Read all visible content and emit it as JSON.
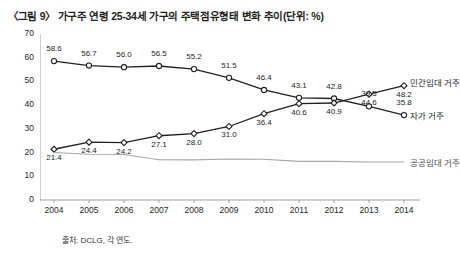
{
  "title": "〈그림 9〉 가구주 연령 25-34세 가구의 주택점유형태 변화 추이(단위: %)",
  "source": "출처: DCLG, 각 연도.",
  "chart_data": {
    "type": "line",
    "title": "〈그림 9〉 가구주 연령 25-34세 가구의 주택점유형태 변화 추이(단위: %)",
    "xlabel": "",
    "ylabel": "",
    "ylim": [
      0,
      70
    ],
    "yticks": [
      0,
      10,
      20,
      30,
      40,
      50,
      60,
      70
    ],
    "grid": false,
    "legend": "inline-right",
    "categories": [
      "2004",
      "2005",
      "2006",
      "2007",
      "2008",
      "2009",
      "2010",
      "2011",
      "2012",
      "2013",
      "2014"
    ],
    "series": [
      {
        "name": "자가 거주",
        "color": "#231f20",
        "marker": "circle-open",
        "values": [
          58.6,
          56.7,
          56.0,
          56.5,
          55.2,
          51.5,
          46.4,
          43.1,
          42.8,
          39.5,
          35.8
        ],
        "labels": [
          "58.6",
          "56.7",
          "56.0",
          "56.5",
          "55.2",
          "51.5",
          "46.4",
          "43.1",
          "42.8",
          "39.5",
          "35.8"
        ]
      },
      {
        "name": "민간임대 거주",
        "color": "#231f20",
        "marker": "diamond-open",
        "values": [
          21.4,
          24.4,
          24.2,
          27.1,
          28.0,
          31.0,
          36.4,
          40.6,
          40.9,
          44.6,
          48.2
        ],
        "labels": [
          "21.4",
          "24.4",
          "24.2",
          "27.1",
          "28.0",
          "31.0",
          "36.4",
          "40.6",
          "40.9",
          "44.6",
          "48.2"
        ]
      },
      {
        "name": "공공임대 거주",
        "color": "#a6a6a6",
        "marker": "none",
        "values": [
          20.0,
          19.3,
          19.2,
          17.0,
          16.9,
          17.3,
          17.2,
          16.3,
          16.3,
          16.0,
          16.0
        ],
        "labels": []
      }
    ],
    "series_labels": [
      {
        "text": "민간임대 거주",
        "value": 48.2
      },
      {
        "text": "자가 거주",
        "value": 35.8
      },
      {
        "text": "공공임대 거주",
        "value": 16.0
      }
    ]
  }
}
